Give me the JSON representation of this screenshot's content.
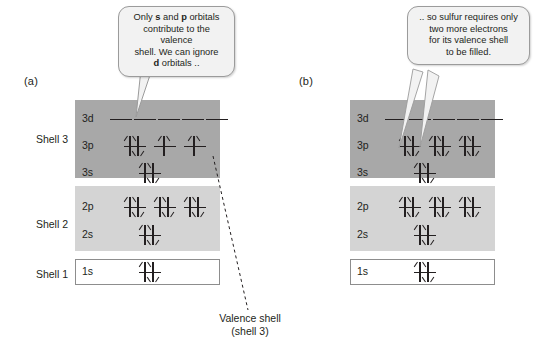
{
  "figure": {
    "panels": [
      {
        "letter": "(a)",
        "shell_labels": [
          "Shell 3",
          "Shell 2",
          "Shell 1"
        ],
        "subshells": [
          {
            "name": "3d",
            "slots": 5,
            "electrons": [
              0,
              0,
              0,
              0,
              0
            ]
          },
          {
            "name": "3p",
            "slots": 3,
            "electrons": [
              2,
              1,
              1
            ]
          },
          {
            "name": "3s",
            "slots": 1,
            "electrons": [
              2
            ]
          },
          {
            "name": "2p",
            "slots": 3,
            "electrons": [
              2,
              2,
              2
            ]
          },
          {
            "name": "2s",
            "slots": 1,
            "electrons": [
              2
            ]
          },
          {
            "name": "1s",
            "slots": 1,
            "electrons": [
              2
            ]
          }
        ],
        "callout": {
          "line1_a": "Only ",
          "line1_b": "s",
          "line1_c": " and ",
          "line1_d": "p",
          "line1_e": " orbitals",
          "line2": "contribute to the valence",
          "line3": "shell. We can ignore",
          "line4_a": "d",
          "line4_b": " orbitals .."
        },
        "annotation": "Valence shell\n(shell 3)"
      },
      {
        "letter": "(b)",
        "shell_labels": [
          "",
          "",
          ""
        ],
        "subshells": [
          {
            "name": "3d",
            "slots": 5,
            "electrons": [
              0,
              0,
              0,
              0,
              0
            ]
          },
          {
            "name": "3p",
            "slots": 3,
            "electrons": [
              2,
              2,
              2
            ]
          },
          {
            "name": "3s",
            "slots": 1,
            "electrons": [
              2
            ]
          },
          {
            "name": "2p",
            "slots": 3,
            "electrons": [
              2,
              2,
              2
            ]
          },
          {
            "name": "2s",
            "slots": 1,
            "electrons": [
              2
            ]
          },
          {
            "name": "1s",
            "slots": 1,
            "electrons": [
              2
            ]
          }
        ],
        "callout": {
          "line1": ".. so sulfur requires only",
          "line2": "two more electrons",
          "line3": "for its valence shell",
          "line4": "to be filled."
        }
      }
    ],
    "colors": {
      "shell3_fill": "#a8a8a8",
      "shell2_fill": "#d4d4d4",
      "shell1_fill": "#ffffff",
      "shell1_border": "#8d8d8d",
      "callout_fill": "#f2f2f2",
      "callout_border": "#9b9b9b",
      "ink": "#231f20",
      "page_background": "#ffffff"
    }
  }
}
